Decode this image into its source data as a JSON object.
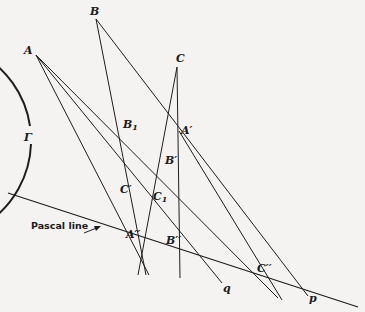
{
  "diagram": {
    "conic_label": "Γ",
    "points": {
      "A": "A",
      "B": "B",
      "C": "C",
      "A_prime": "A′",
      "B_prime": "B′",
      "C_prime": "C′",
      "B1": "B",
      "B1_sub": "1",
      "C1": "C",
      "C1_sub": "1",
      "A_dprime": "A′′",
      "B_dprime": "B′′",
      "C_dprime": "C′′"
    },
    "lines": {
      "p": "p",
      "q": "q"
    },
    "pascal_line_label": "Pascal line"
  }
}
